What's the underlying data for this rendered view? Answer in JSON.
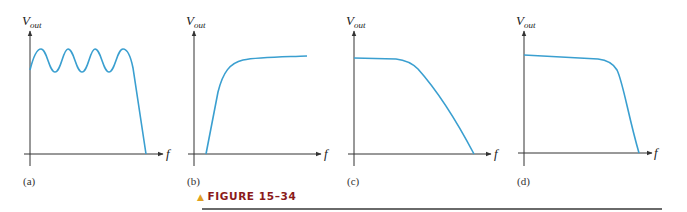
{
  "figure": {
    "caption_label": "FIGURE 15–34",
    "caption_marker": "▲",
    "curve_color": "#3a9fd0",
    "axis_color": "#333333",
    "caption_color": "#8b1a1a",
    "marker_color": "#e0a020"
  },
  "panels": [
    {
      "id": "a",
      "label": "(a)",
      "y_axis": "V",
      "y_sub": "out",
      "x_axis": "f",
      "response": "Chebyshev low-pass (ripple in passband)"
    },
    {
      "id": "b",
      "label": "(b)",
      "y_axis": "V",
      "y_sub": "out",
      "x_axis": "f",
      "response": "High-pass"
    },
    {
      "id": "c",
      "label": "(c)",
      "y_axis": "V",
      "y_sub": "out",
      "x_axis": "f",
      "response": "Gradual roll-off low-pass (Bessel)"
    },
    {
      "id": "d",
      "label": "(d)",
      "y_axis": "V",
      "y_sub": "out",
      "x_axis": "f",
      "response": "Flat passband, steep roll-off low-pass (Butterworth)"
    }
  ]
}
